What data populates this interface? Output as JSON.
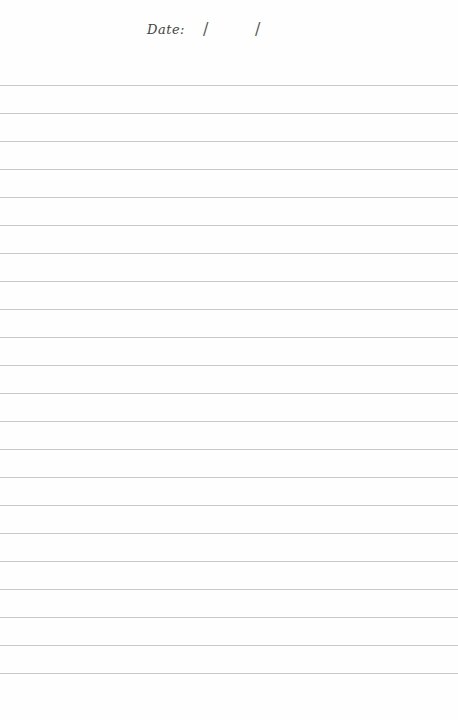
{
  "header": {
    "date_label": "Date:",
    "date_separator_1": "/",
    "date_separator_2": "/"
  },
  "ruled_lines": {
    "count": 22,
    "first_line_y": 85,
    "spacing_px": 28,
    "color": "#c9c9c9"
  },
  "colors": {
    "paper": "#fefefe",
    "ink": "#444444"
  }
}
